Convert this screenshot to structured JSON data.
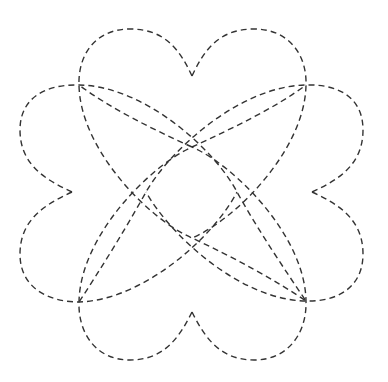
{
  "figure": {
    "stroke_color": "#333333",
    "background_color": "#ffffff",
    "shapes": [
      {
        "name": "heart-top",
        "notch": [
          192,
          76
        ]
      },
      {
        "name": "heart-left",
        "notch": [
          72,
          192
        ]
      },
      {
        "name": "heart-right",
        "notch": [
          312,
          192
        ]
      },
      {
        "name": "heart-bottom",
        "notch": [
          192,
          312
        ]
      }
    ]
  }
}
